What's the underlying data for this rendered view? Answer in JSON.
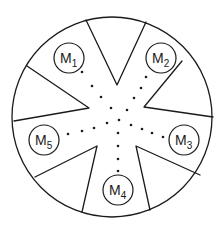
{
  "diagram": {
    "type": "circular-chamber-with-wedge-partitions",
    "outer_circle": {
      "cx": 112,
      "cy": 117,
      "r": 100
    },
    "stroke_color": "#1a1a1a",
    "background_color": "#ffffff",
    "wedges": [
      {
        "name": "top",
        "points": [
          [
            86,
            20
          ],
          [
            117,
            85
          ],
          [
            146,
            22
          ]
        ]
      },
      {
        "name": "upper-right",
        "points": [
          [
            182,
            61
          ],
          [
            144,
            107
          ],
          [
            213,
            117
          ]
        ]
      },
      {
        "name": "lower-right",
        "points": [
          [
            200,
            175
          ],
          [
            136,
            146
          ],
          [
            150,
            210
          ]
        ]
      },
      {
        "name": "lower-left",
        "points": [
          [
            82,
            212
          ],
          [
            97,
            146
          ],
          [
            35,
            177
          ]
        ]
      },
      {
        "name": "left",
        "points": [
          [
            14,
            121
          ],
          [
            89,
            108
          ],
          [
            27,
            66
          ]
        ]
      }
    ],
    "modules": [
      {
        "id": "M1",
        "base": "M",
        "sub": "1",
        "cx": 69,
        "cy": 58,
        "r": 15
      },
      {
        "id": "M2",
        "base": "M",
        "sub": "2",
        "cx": 161,
        "cy": 58,
        "r": 15
      },
      {
        "id": "M3",
        "base": "M",
        "sub": "3",
        "cx": 184,
        "cy": 140,
        "r": 15
      },
      {
        "id": "M4",
        "base": "M",
        "sub": "4",
        "cx": 118,
        "cy": 190,
        "r": 15
      },
      {
        "id": "M5",
        "base": "M",
        "sub": "5",
        "cx": 44,
        "cy": 140,
        "r": 15
      }
    ],
    "dot_paths": [
      {
        "to": "M1",
        "dots": [
          [
            82,
            72
          ],
          [
            92,
            86
          ],
          [
            101,
            97
          ],
          [
            111,
            108
          ]
        ]
      },
      {
        "to": "M2",
        "dots": [
          [
            146,
            77
          ],
          [
            141,
            88
          ],
          [
            134,
            98
          ],
          [
            127,
            110
          ]
        ]
      },
      {
        "to": "center",
        "dots": [
          [
            107,
            123
          ],
          [
            119,
            120
          ],
          [
            131,
            125
          ]
        ]
      },
      {
        "to": "M5",
        "dots": [
          [
            68,
            134
          ],
          [
            82,
            131
          ],
          [
            94,
            128
          ]
        ]
      },
      {
        "to": "M3",
        "dots": [
          [
            142,
            129
          ],
          [
            152,
            133
          ],
          [
            163,
            137
          ]
        ]
      },
      {
        "to": "M4",
        "dots": [
          [
            118,
            133
          ],
          [
            118,
            146
          ],
          [
            118,
            159
          ],
          [
            118,
            171
          ]
        ]
      }
    ]
  },
  "labels": {
    "m1": {
      "base": "M",
      "sub": "1"
    },
    "m2": {
      "base": "M",
      "sub": "2"
    },
    "m3": {
      "base": "M",
      "sub": "3"
    },
    "m4": {
      "base": "M",
      "sub": "4"
    },
    "m5": {
      "base": "M",
      "sub": "5"
    }
  }
}
